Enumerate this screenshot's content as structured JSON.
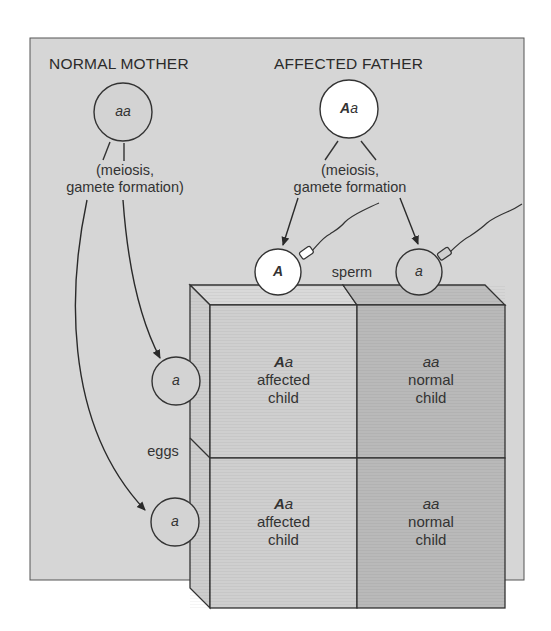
{
  "parents": {
    "mother": {
      "label": "NORMAL MOTHER",
      "genotype": "aa",
      "process": [
        "(meiosis,",
        "gamete formation)"
      ]
    },
    "father": {
      "label": "AFFECTED FATHER",
      "genotype_dominant": "A",
      "genotype_recessive": "a",
      "process": [
        "(meiosis,",
        "gamete formation"
      ]
    }
  },
  "gametes": {
    "sperm_label": "sperm",
    "eggs_label": "eggs",
    "sperm": [
      {
        "allele": "A",
        "fill": "#ffffff"
      },
      {
        "allele": "a",
        "fill": "#d3d3d3"
      }
    ],
    "eggs": [
      {
        "allele": "a"
      },
      {
        "allele": "a"
      }
    ]
  },
  "punnett": {
    "cells": [
      {
        "row": 0,
        "col": 0,
        "genotype_dominant": "A",
        "genotype_recessive": "a",
        "line1": "affected",
        "line2": "child",
        "fill": "#cfcfcf"
      },
      {
        "row": 0,
        "col": 1,
        "genotype": "aa",
        "line1": "normal",
        "line2": "child",
        "fill": "#b9b9b9"
      },
      {
        "row": 1,
        "col": 0,
        "genotype_dominant": "A",
        "genotype_recessive": "a",
        "line1": "affected",
        "line2": "child",
        "fill": "#cfcfcf"
      },
      {
        "row": 1,
        "col": 1,
        "genotype": "aa",
        "line1": "normal",
        "line2": "child",
        "fill": "#b9b9b9"
      }
    ]
  },
  "colors": {
    "panel": "#d6d6d6",
    "stroke": "#3a3a3a",
    "affected_cell": "#cfcfcf",
    "normal_cell": "#b9b9b9"
  }
}
